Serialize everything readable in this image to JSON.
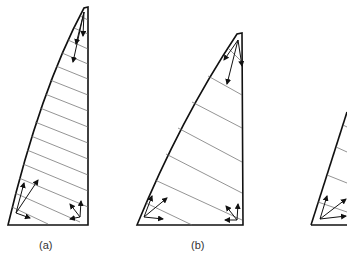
{
  "figure": {
    "panels": [
      {
        "id": "a",
        "label": "(a)",
        "hatch_lines": 14
      },
      {
        "id": "b",
        "label": "(b)",
        "hatch_lines": 6
      },
      {
        "id": "c",
        "label": "",
        "hatch_lines": 4
      }
    ],
    "colors": {
      "stroke": "#111111",
      "hatch": "#555555",
      "background": "#ffffff"
    }
  }
}
